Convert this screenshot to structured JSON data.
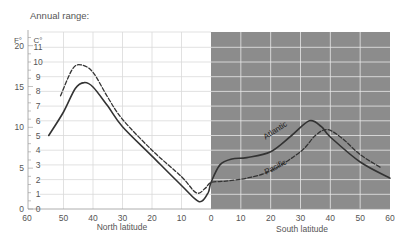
{
  "chart_data": {
    "type": "line",
    "title": "Annual range:",
    "y_units": {
      "left_outer": "F°",
      "left_inner": "C°"
    },
    "y_ticks_F": [
      0,
      5,
      10,
      15,
      20
    ],
    "y_ticks_C": [
      0,
      1,
      2,
      3,
      4,
      5,
      6,
      7,
      8,
      9,
      10,
      11
    ],
    "ylim_C": [
      0,
      12
    ],
    "x_ticks_north": [
      60,
      50,
      40,
      30,
      20,
      10,
      0
    ],
    "x_ticks_south": [
      0,
      10,
      20,
      30,
      40,
      50,
      60
    ],
    "xlabel_north": "North latitude",
    "xlabel_south": "South latitude",
    "south_shaded": true,
    "grid": true,
    "series": [
      {
        "name": "Atlantic",
        "style": "solid",
        "points": [
          {
            "lat": 55,
            "c": 5.0
          },
          {
            "lat": 50,
            "c": 6.6
          },
          {
            "lat": 46,
            "c": 8.2
          },
          {
            "lat": 43,
            "c": 8.6
          },
          {
            "lat": 40,
            "c": 8.3
          },
          {
            "lat": 35,
            "c": 7.0
          },
          {
            "lat": 30,
            "c": 5.6
          },
          {
            "lat": 20,
            "c": 3.6
          },
          {
            "lat": 10,
            "c": 1.6
          },
          {
            "lat": 4,
            "c": 0.5
          },
          {
            "lat": 1,
            "c": 1.1
          },
          {
            "lat": 0,
            "c": 1.8
          },
          {
            "lat": -3,
            "c": 3.0
          },
          {
            "lat": -7,
            "c": 3.4
          },
          {
            "lat": -12,
            "c": 3.5
          },
          {
            "lat": -20,
            "c": 3.9
          },
          {
            "lat": -27,
            "c": 5.0
          },
          {
            "lat": -33,
            "c": 6.0
          },
          {
            "lat": -37,
            "c": 5.6
          },
          {
            "lat": -40,
            "c": 4.9
          },
          {
            "lat": -50,
            "c": 3.2
          },
          {
            "lat": -60,
            "c": 2.1
          }
        ]
      },
      {
        "name": "Pacific",
        "style": "dashed",
        "points": [
          {
            "lat": 51,
            "c": 7.7
          },
          {
            "lat": 47,
            "c": 9.5
          },
          {
            "lat": 44,
            "c": 9.8
          },
          {
            "lat": 40,
            "c": 9.3
          },
          {
            "lat": 35,
            "c": 7.6
          },
          {
            "lat": 30,
            "c": 6.1
          },
          {
            "lat": 20,
            "c": 4.0
          },
          {
            "lat": 10,
            "c": 2.2
          },
          {
            "lat": 5,
            "c": 1.1
          },
          {
            "lat": 2,
            "c": 1.4
          },
          {
            "lat": 0,
            "c": 1.8
          },
          {
            "lat": -5,
            "c": 1.9
          },
          {
            "lat": -12,
            "c": 2.1
          },
          {
            "lat": -20,
            "c": 2.6
          },
          {
            "lat": -30,
            "c": 3.9
          },
          {
            "lat": -35,
            "c": 5.0
          },
          {
            "lat": -39,
            "c": 5.4
          },
          {
            "lat": -44,
            "c": 4.8
          },
          {
            "lat": -50,
            "c": 3.7
          },
          {
            "lat": -57,
            "c": 2.8
          }
        ]
      }
    ],
    "annotations": [
      {
        "text": "Atlantic",
        "lat": -22,
        "c": 5.2,
        "rotate": -33
      },
      {
        "text": "Pacific",
        "lat": -22,
        "c": 2.7,
        "rotate": -28
      }
    ]
  },
  "colors": {
    "shade": "#8c8c8c",
    "grid_light": "#d9d9d9",
    "grid_on_shade": "#e8e8e8",
    "line": "#333333",
    "text": "#555555"
  }
}
